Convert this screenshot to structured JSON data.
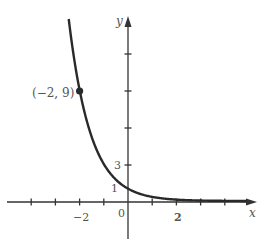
{
  "chart_data": {
    "type": "line",
    "title": "",
    "function": "y = 3^(-x)",
    "xlabel": "x",
    "ylabel": "y",
    "xlim": [
      -5,
      5.4
    ],
    "ylim": [
      -3,
      15.5
    ],
    "x_ticks": [
      -4,
      -3,
      -2,
      -1,
      1,
      2,
      3,
      4
    ],
    "x_tick_labels": [
      {
        "value": -2,
        "label": "−2"
      },
      {
        "value": 2,
        "label": "2"
      }
    ],
    "y_ticks": [
      3,
      6,
      9,
      12
    ],
    "y_tick_labels": [
      {
        "value": 3,
        "label": "3"
      },
      {
        "value": 1,
        "label": "1"
      }
    ],
    "origin_label": "0",
    "grid": false,
    "legend": null,
    "series": [
      {
        "name": "f(x) = 3^(-x)",
        "x": [
          -2.5,
          -2,
          -1.5,
          -1,
          -0.5,
          0,
          0.5,
          1,
          1.5,
          2,
          2.5,
          3,
          3.5,
          4,
          4.5
        ],
        "y": [
          15.59,
          9,
          5.2,
          3,
          1.73,
          1,
          0.58,
          0.33,
          0.19,
          0.11,
          0.06,
          0.04,
          0.02,
          0.01,
          0.007
        ]
      }
    ],
    "annotations": [
      {
        "x": -2,
        "y": 9,
        "label": "(−2, 9)",
        "marker": "dot"
      }
    ]
  },
  "colors": {
    "axis": "#333333",
    "curve": "#2a2a2a",
    "label": "#555555",
    "background": "#ffffff"
  }
}
